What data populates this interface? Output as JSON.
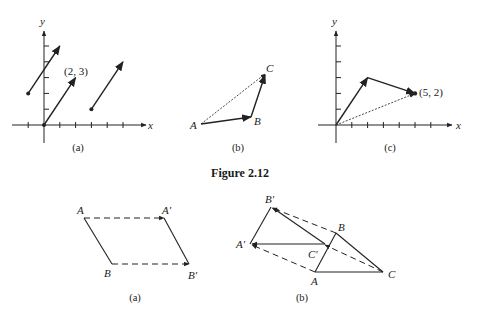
{
  "figure_caption": "Figure 2.12",
  "colors": {
    "ink": "#222222",
    "background": "#ffffff"
  },
  "panels_top": [
    {
      "id": "a",
      "caption": "(a)",
      "axis_labels": {
        "x": "x",
        "y": "y"
      },
      "vectors": [
        {
          "from": [
            0,
            0
          ],
          "to": [
            2,
            3
          ],
          "label": "(2, 3)",
          "style": "solid"
        },
        {
          "from": [
            -1,
            2
          ],
          "to": [
            1,
            5
          ],
          "style": "solid"
        },
        {
          "from": [
            3,
            1
          ],
          "to": [
            5,
            4
          ],
          "style": "solid"
        }
      ]
    },
    {
      "id": "b",
      "caption": "(b)",
      "points": {
        "A": "A",
        "B": "B",
        "C": "C"
      },
      "vectors": [
        {
          "from": "A",
          "to": "B",
          "style": "solid"
        },
        {
          "from": "B",
          "to": "C",
          "style": "solid"
        },
        {
          "from": "A",
          "to": "C",
          "style": "dotted"
        }
      ]
    },
    {
      "id": "c",
      "caption": "(c)",
      "axis_labels": {
        "x": "x",
        "y": "y"
      },
      "point_label": "(5, 2)",
      "vectors": [
        {
          "from": [
            0,
            0
          ],
          "to": [
            2,
            3
          ],
          "style": "solid"
        },
        {
          "from": [
            2,
            3
          ],
          "to": [
            5,
            2
          ],
          "style": "solid"
        },
        {
          "from": [
            0,
            0
          ],
          "to": [
            5,
            2
          ],
          "style": "dotted"
        }
      ]
    }
  ],
  "panels_bottom": [
    {
      "id": "a",
      "caption": "(a)",
      "labels": {
        "A": "A",
        "A_prime": "A′",
        "B": "B",
        "B_prime": "B′"
      }
    },
    {
      "id": "b",
      "caption": "(b)",
      "labels": {
        "A": "A",
        "B": "B",
        "C": "C",
        "A_prime": "A′",
        "B_prime": "B′",
        "C_prime": "C′"
      }
    }
  ]
}
